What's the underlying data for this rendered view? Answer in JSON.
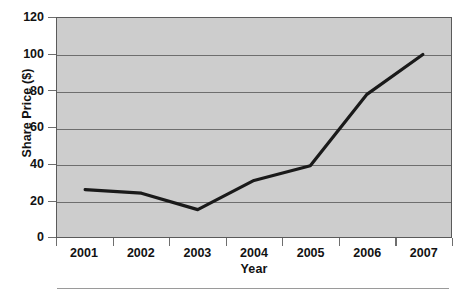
{
  "chart_data": {
    "type": "line",
    "title": "",
    "xlabel": "Year",
    "ylabel": "Share Price ($)",
    "categories": [
      "2001",
      "2002",
      "2003",
      "2004",
      "2005",
      "2006",
      "2007"
    ],
    "x": [
      2001,
      2002,
      2003,
      2004,
      2005,
      2006,
      2007
    ],
    "values": [
      26,
      24,
      15,
      31,
      39,
      78,
      100
    ],
    "series": [
      {
        "name": "Share Price",
        "values": [
          26,
          24,
          15,
          31,
          39,
          78,
          100
        ]
      }
    ],
    "ylim": [
      0,
      120
    ],
    "yticks": [
      0,
      20,
      40,
      60,
      80,
      100,
      120
    ],
    "ytick_labels": [
      "0",
      "20",
      "40",
      "60",
      "80",
      "100",
      "120"
    ],
    "xtick_labels": [
      "2001",
      "2002",
      "2003",
      "2004",
      "2005",
      "2006",
      "2007"
    ],
    "grid": "horizontal",
    "legend": "none",
    "plot_background_color": "#cdcdcd",
    "line_color": "#1a1a1a",
    "gridline_color": "#6e6e6e",
    "axis_color": "#5a5a5a",
    "text_color": "#121212"
  }
}
